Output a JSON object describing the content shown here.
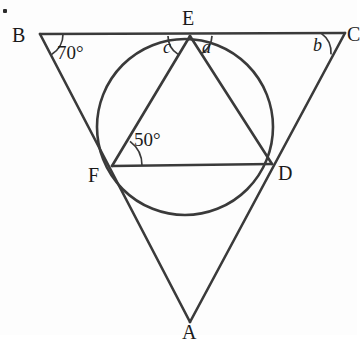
{
  "figure": {
    "stroke_color": "#3a3a3a",
    "text_color": "#1a1a1a",
    "background": "#fdfdfd",
    "canvas": {
      "width": 357,
      "height": 335
    }
  },
  "vertices": {
    "B": {
      "label": "B",
      "x": 40,
      "y": 34,
      "label_x": 12,
      "label_y": 25
    },
    "C": {
      "label": "C",
      "x": 343,
      "y": 33,
      "label_x": 347,
      "label_y": 24
    },
    "A": {
      "label": "A",
      "x": 190,
      "y": 320,
      "label_x": 182,
      "label_y": 322
    },
    "E": {
      "label": "E",
      "x": 190,
      "y": 36,
      "label_x": 182,
      "label_y": 8
    },
    "F": {
      "label": "F",
      "x": 112,
      "y": 166,
      "label_x": 88,
      "label_y": 165
    },
    "D": {
      "label": "D",
      "x": 272,
      "y": 164,
      "label_x": 278,
      "label_y": 163
    }
  },
  "circle": {
    "center_x": 185,
    "center_y": 127,
    "radius": 88
  },
  "angles": [
    {
      "name": "angle-b-70",
      "label": "70°",
      "vertex": "B",
      "label_x": 57,
      "label_y": 43,
      "arc_radius": 23
    },
    {
      "name": "angle-f-50",
      "label": "50°",
      "vertex": "F",
      "label_x": 134,
      "label_y": 130,
      "arc_radius": 30
    },
    {
      "name": "angle-e-c",
      "label": "c",
      "vertex": "E",
      "label_x": 163,
      "label_y": 38,
      "arc_radius": 22
    },
    {
      "name": "angle-e-a",
      "label": "a",
      "vertex": "E",
      "label_x": 202,
      "label_y": 38,
      "arc_radius": 22
    },
    {
      "name": "angle-c-b",
      "label": "b",
      "vertex": "C",
      "label_x": 313,
      "label_y": 36,
      "arc_radius": 24
    }
  ],
  "segments": [
    {
      "name": "segment-BC",
      "from": "B",
      "to": "C"
    },
    {
      "name": "segment-BA",
      "from": "B",
      "to": "A"
    },
    {
      "name": "segment-CA",
      "from": "C",
      "to": "A"
    },
    {
      "name": "segment-EF",
      "from": "E",
      "to": "F"
    },
    {
      "name": "segment-ED",
      "from": "E",
      "to": "D"
    },
    {
      "name": "segment-FD",
      "from": "F",
      "to": "D"
    }
  ],
  "marks": {
    "corner_dot": {
      "x": 3,
      "y": 9
    }
  }
}
